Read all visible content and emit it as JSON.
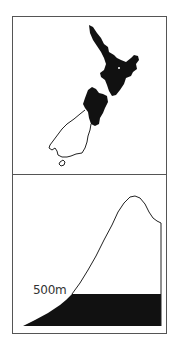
{
  "figure": {
    "panels": [
      {
        "id": "map",
        "description": "Map of New Zealand with North Island and northern part of South Island shaded black, southern South Island outlined"
      },
      {
        "id": "profile",
        "description": "Mountain elevation profile with area below 500m shaded black",
        "label": "500m"
      }
    ],
    "colors": {
      "ink": "#111111",
      "border": "#555555",
      "background": "#ffffff"
    }
  }
}
